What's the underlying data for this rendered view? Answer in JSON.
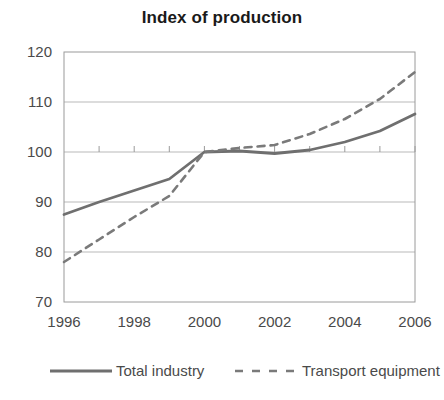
{
  "chart_data": {
    "type": "line",
    "title": "Index of production",
    "xlabel": "",
    "ylabel": "",
    "x": [
      1996,
      1997,
      1998,
      1999,
      2000,
      2001,
      2002,
      2003,
      2004,
      2005,
      2006
    ],
    "xlim": [
      1996,
      2006
    ],
    "ylim": [
      70,
      120
    ],
    "ytick_labels": [
      "120",
      "110",
      "100",
      "90",
      "80",
      "70"
    ],
    "ytick_values": [
      120,
      110,
      100,
      90,
      80,
      70
    ],
    "xtick_labels": [
      "1996",
      "1998",
      "2000",
      "2002",
      "2004",
      "2006"
    ],
    "xtick_values": [
      1996,
      1998,
      2000,
      2002,
      2004,
      2006
    ],
    "grid": true,
    "legend_position": "bottom",
    "series": [
      {
        "name": "Total industry",
        "style": "solid",
        "color": "#6f6f6f",
        "values": [
          87.5,
          90.0,
          92.3,
          94.6,
          100.0,
          100.2,
          99.7,
          100.4,
          102.0,
          104.2,
          107.6
        ]
      },
      {
        "name": "Transport equipment",
        "style": "dashed",
        "color": "#7a7a7a",
        "values": [
          78.0,
          82.5,
          87.0,
          91.2,
          100.0,
          100.8,
          101.4,
          103.6,
          106.6,
          110.6,
          116.0
        ]
      }
    ]
  },
  "legend": {
    "items": [
      {
        "label": "Total industry",
        "style": "solid"
      },
      {
        "label": "Transport equipment",
        "style": "dashed"
      }
    ]
  },
  "colors": {
    "series_solid": "#6f6f6f",
    "series_dashed": "#7a7a7a",
    "grid": "#b9b9b9",
    "axis": "#9a9a9a",
    "text": "#4a4a4a",
    "title": "#1a1a1a",
    "background": "#ffffff"
  }
}
